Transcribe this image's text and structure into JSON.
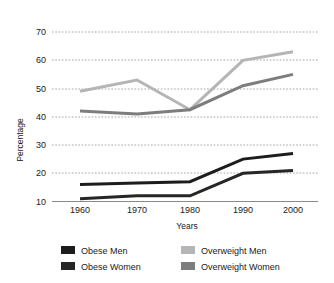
{
  "chart_data": {
    "type": "line",
    "title": "",
    "xlabel": "Years",
    "ylabel": "Percentage",
    "categories": [
      "1960",
      "1970",
      "1980",
      "1990",
      "2000"
    ],
    "x": [
      1960,
      1970,
      1980,
      1990,
      2000
    ],
    "xlim": [
      1955,
      2005
    ],
    "ylim": [
      10,
      72
    ],
    "yticks": [
      10,
      20,
      30,
      40,
      50,
      60,
      70
    ],
    "ytick_labels": [
      "10",
      "20",
      "30",
      "40",
      "50",
      "60",
      "70"
    ],
    "grid": true,
    "grid_style": "dotted-horizontal",
    "legend_position": "bottom",
    "series": [
      {
        "name": "Obese Men",
        "color": "#1c1c1c",
        "values": [
          16,
          16.5,
          17,
          25,
          27
        ]
      },
      {
        "name": "Obese Women",
        "color": "#262626",
        "values": [
          11,
          12,
          12,
          20,
          21
        ]
      },
      {
        "name": "Overweight Men",
        "color": "#b5b5b5",
        "values": [
          49,
          53,
          42.5,
          60,
          63
        ]
      },
      {
        "name": "Overweight Women",
        "color": "#7d7d7d",
        "values": [
          42,
          41,
          42.5,
          51,
          55
        ]
      }
    ]
  },
  "legend": {
    "entries": [
      {
        "label": "Obese Men",
        "color": "#1c1c1c"
      },
      {
        "label": "Obese Women",
        "color": "#262626"
      },
      {
        "label": "Overweight Men",
        "color": "#b5b5b5"
      },
      {
        "label": "Overweight Women",
        "color": "#7d7d7d"
      }
    ]
  },
  "axes": {
    "y_title": "Percentage",
    "x_title": "Years",
    "y_tick_0": "10",
    "y_tick_1": "20",
    "y_tick_2": "30",
    "y_tick_3": "40",
    "y_tick_4": "50",
    "y_tick_5": "60",
    "y_tick_6": "70",
    "x_tick_0": "1960",
    "x_tick_1": "1970",
    "x_tick_2": "1980",
    "x_tick_3": "1990",
    "x_tick_4": "2000"
  },
  "colors": {
    "background": "#ffffff",
    "axis": "#8a8a8a",
    "grid": "#9a9a9a",
    "text": "#1a1a1a"
  }
}
